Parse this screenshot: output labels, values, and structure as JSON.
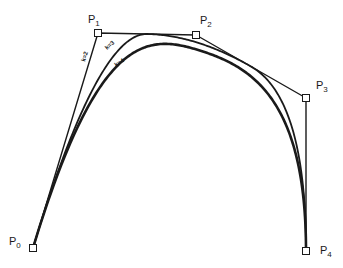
{
  "diagram": {
    "type": "b-spline-curves",
    "control_points": [
      {
        "name": "P",
        "sub": "0",
        "x": 33,
        "y": 248,
        "label_x": 9,
        "label_y": 236
      },
      {
        "name": "P",
        "sub": "1",
        "x": 98,
        "y": 33,
        "label_x": 88,
        "label_y": 14
      },
      {
        "name": "P",
        "sub": "2",
        "x": 196,
        "y": 35,
        "label_x": 200,
        "label_y": 15
      },
      {
        "name": "P",
        "sub": "3",
        "x": 306,
        "y": 98,
        "label_x": 316,
        "label_y": 80
      },
      {
        "name": "P",
        "sub": "4",
        "x": 306,
        "y": 251,
        "label_x": 320,
        "label_y": 245
      }
    ],
    "curves": [
      {
        "order": 2,
        "label": "k=2",
        "stroke_width": 1.4,
        "label_x": 85,
        "label_y": 62,
        "label_angle": -72
      },
      {
        "order": 3,
        "label": "k=3",
        "stroke_width": 1.8,
        "label_x": 107,
        "label_y": 50,
        "label_angle": -40
      },
      {
        "order": 4,
        "label": "k=4",
        "stroke_width": 2.6,
        "label_x": 116,
        "label_y": 67,
        "label_angle": -32
      }
    ],
    "colors": {
      "stroke": "#1a1a1a",
      "marker_fill": "#ffffff"
    }
  }
}
